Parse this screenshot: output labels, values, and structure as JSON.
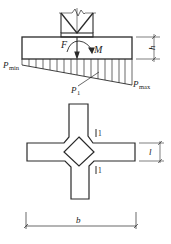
{
  "diagram": {
    "elevation": {
      "force_label": "F",
      "moment_label": "M",
      "height_label": "h",
      "p_min_label": "P",
      "p_min_sub": "min",
      "p_max_label": "P",
      "p_max_sub": "max",
      "p1_label": "P",
      "p1_sub": "1"
    },
    "plan": {
      "section_mark_top": "1",
      "section_mark_bottom": "1",
      "width_label": "b",
      "arm_width_label": "l"
    },
    "colors": {
      "line": "#2a2a2a",
      "background": "#ffffff"
    }
  }
}
